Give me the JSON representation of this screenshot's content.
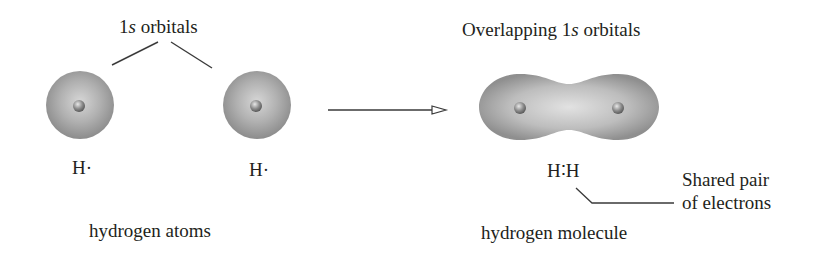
{
  "labels": {
    "orbitals_left": {
      "prefix": "1",
      "italic": "s",
      "suffix": " orbitals"
    },
    "orbitals_right": {
      "prefix": "Overlapping 1",
      "italic": "s",
      "suffix": " orbitals"
    },
    "atom_left": "H·",
    "atom_right": "H·",
    "molecule_formula": "H∶H",
    "shared_pair_line1": "Shared pair",
    "shared_pair_line2": "of electrons",
    "caption_left": "hydrogen atoms",
    "caption_right": "hydrogen molecule"
  },
  "colors": {
    "orbital_light": "#d9d9d9",
    "orbital_dark": "#8a8a8a",
    "nucleus": "#7a7a7a",
    "line": "#3a3a3a",
    "text": "#231f20"
  }
}
